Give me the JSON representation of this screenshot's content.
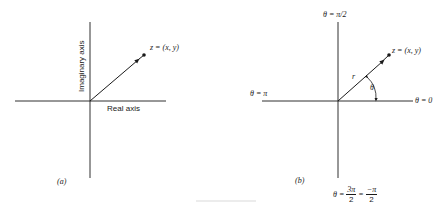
{
  "panel_a": {
    "label": "(a)",
    "vertical_axis_label": "Imaginary axis",
    "horizontal_axis_label": "Real axis",
    "point_label": "z = (x, y)"
  },
  "panel_b": {
    "label": "(b)",
    "top_label": "θ = π/2",
    "left_label": "θ = π",
    "right_label": "θ = 0",
    "vector_label": "r",
    "angle_label": "θ",
    "point_label": "z = (x, y)",
    "bottom_label": {
      "prefix": "θ = ",
      "frac1_num": "3π",
      "frac1_den": "2",
      "equals": " = ",
      "frac2_num": "−π",
      "frac2_den": "2"
    }
  },
  "colors": {
    "ink": "#1a1a1a",
    "background": "#ffffff"
  }
}
